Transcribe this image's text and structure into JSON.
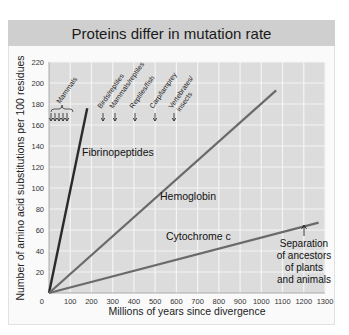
{
  "chart_data": {
    "type": "line",
    "title": "Proteins differ in mutation rate",
    "xlabel": "Millions of years since divergence",
    "ylabel": "Number of amino acid substitutions per 100 residues",
    "xlim": [
      0,
      1300
    ],
    "ylim": [
      0,
      220
    ],
    "x_ticks": [
      0,
      100,
      200,
      300,
      400,
      500,
      600,
      700,
      800,
      900,
      1000,
      1100,
      1200,
      1300
    ],
    "y_ticks": [
      0,
      20,
      40,
      60,
      80,
      100,
      120,
      140,
      160,
      180,
      200,
      220
    ],
    "grid": true,
    "series": [
      {
        "name": "Fibrinopeptides",
        "x": [
          0,
          180
        ],
        "y": [
          0,
          176
        ],
        "color": "#2a2a2a"
      },
      {
        "name": "Hemoglobin",
        "x": [
          0,
          1070
        ],
        "y": [
          0,
          193
        ],
        "color": "#6a6a6a"
      },
      {
        "name": "Cytochrome c",
        "x": [
          0,
          1270
        ],
        "y": [
          0,
          67
        ],
        "color": "#6a6a6a"
      }
    ],
    "annotations": [
      {
        "text": "Mammals",
        "x": [
          20,
          40,
          60,
          80,
          100
        ],
        "y": 160
      },
      {
        "text": "Birds/reptiles",
        "x": 280,
        "y": 160
      },
      {
        "text": "Mammals/reptiles",
        "x": 320,
        "y": 160
      },
      {
        "text": "Reptiles/fish",
        "x": 420,
        "y": 160
      },
      {
        "text": "Carp/lamprey",
        "x": 540,
        "y": 160
      },
      {
        "text": "Vertebrates/ insects",
        "x": 620,
        "y": 160
      },
      {
        "text": "Separation of ancestors of plants and animals",
        "x": 1200,
        "y": 58
      }
    ]
  },
  "labels": {
    "title": "Proteins differ in mutation rate",
    "xlabel": "Millions of years since divergence",
    "ylabel": "Number of amino acid substitutions per 100 residues",
    "fibrinopeptides": "Fibrinopeptides",
    "hemoglobin": "Hemoglobin",
    "cytochrome": "Cytochrome c",
    "mammals": "Mammals",
    "birds_reptiles": "Birds/reptiles",
    "mammals_reptiles": "Mammals/reptiles",
    "reptiles_fish": "Reptiles/fish",
    "carp_lamprey": "Carp/lamprey",
    "vert_line1": "Vertebrates/",
    "vert_line2": "insects",
    "sep1": "Separation",
    "sep2": "of ancestors",
    "sep3": "of plants",
    "sep4": "and animals"
  }
}
